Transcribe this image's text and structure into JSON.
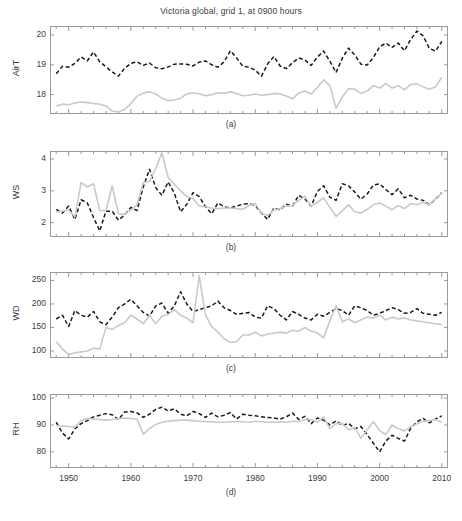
{
  "figure": {
    "title": "Victoria global, grid 1, at 0900 hours",
    "width": 462,
    "height": 521,
    "background": "#ffffff"
  },
  "style": {
    "observed_color": "#1a1a1a",
    "model_color": "#c9c9c9",
    "axis_color": "#9a9a9a",
    "text_color": "#3c3c3c"
  },
  "xaxis": {
    "label": "",
    "min": 1947,
    "max": 2011,
    "ticks": [
      1950,
      1960,
      1970,
      1980,
      1990,
      2000,
      2010
    ],
    "tick_labels": [
      "1950",
      "1960",
      "1970",
      "1980",
      "1990",
      "2000",
      "2010"
    ],
    "minor_tick_interval": 2
  },
  "captions": {
    "a": "(a)",
    "b": "(b)",
    "c": "(c)",
    "d": "(d)"
  },
  "chart_data": [
    {
      "type": "line",
      "panel": "(a)",
      "title": "Victoria global, grid 1, at 0900 hours",
      "xlabel": "",
      "ylabel": "AirT",
      "xlim": [
        1947,
        2011
      ],
      "ylim": [
        17.35,
        20.3
      ],
      "yticks": [
        18,
        19,
        20
      ],
      "ytick_labels": [
        "18",
        "19",
        "20"
      ],
      "grid": false,
      "legend": "none",
      "x": [
        1948,
        1949,
        1950,
        1951,
        1952,
        1953,
        1954,
        1955,
        1956,
        1957,
        1958,
        1959,
        1960,
        1961,
        1962,
        1963,
        1964,
        1965,
        1966,
        1967,
        1968,
        1969,
        1970,
        1971,
        1972,
        1973,
        1974,
        1975,
        1976,
        1977,
        1978,
        1979,
        1980,
        1981,
        1982,
        1983,
        1984,
        1985,
        1986,
        1987,
        1988,
        1989,
        1990,
        1991,
        1992,
        1993,
        1994,
        1995,
        1996,
        1997,
        1998,
        1999,
        2000,
        2001,
        2002,
        2003,
        2004,
        2005,
        2006,
        2007,
        2008,
        2009,
        2010
      ],
      "series": [
        {
          "name": "observed",
          "style": "dashed",
          "color": "#1a1a1a",
          "values": [
            18.7,
            18.95,
            18.92,
            19.05,
            19.26,
            19.13,
            19.43,
            19.1,
            18.93,
            18.76,
            18.62,
            18.88,
            19.05,
            19.1,
            18.98,
            19.06,
            18.9,
            18.87,
            18.93,
            19.02,
            19.03,
            19.02,
            18.96,
            19.09,
            19.13,
            19.0,
            18.92,
            19.1,
            19.47,
            19.23,
            18.95,
            18.92,
            18.82,
            18.62,
            19.03,
            19.28,
            18.96,
            18.87,
            19.07,
            19.23,
            19.16,
            18.98,
            19.26,
            19.46,
            19.12,
            18.74,
            19.22,
            19.56,
            19.33,
            19.02,
            18.99,
            19.24,
            19.6,
            19.73,
            19.58,
            19.73,
            19.47,
            19.85,
            20.13,
            19.97,
            19.55,
            19.46,
            19.78
          ]
        },
        {
          "name": "modelled",
          "style": "solid",
          "color": "#c9c9c9",
          "values": [
            17.62,
            17.68,
            17.66,
            17.72,
            17.75,
            17.73,
            17.7,
            17.68,
            17.62,
            17.45,
            17.42,
            17.5,
            17.7,
            17.95,
            18.05,
            18.1,
            18.02,
            17.88,
            17.8,
            17.82,
            17.88,
            18.02,
            18.06,
            18.02,
            17.96,
            18.0,
            18.06,
            18.04,
            18.1,
            18.04,
            17.96,
            17.98,
            18.02,
            17.98,
            18.0,
            18.04,
            18.02,
            17.95,
            17.86,
            18.05,
            18.12,
            18.02,
            18.24,
            18.5,
            18.3,
            17.54,
            17.92,
            18.2,
            18.18,
            18.04,
            18.12,
            18.3,
            18.22,
            18.38,
            18.22,
            18.3,
            18.16,
            18.34,
            18.36,
            18.26,
            18.18,
            18.26,
            18.58
          ]
        }
      ]
    },
    {
      "type": "line",
      "panel": "(b)",
      "title": "",
      "xlabel": "",
      "ylabel": "WS",
      "xlim": [
        1947,
        2011
      ],
      "ylim": [
        1.55,
        4.25
      ],
      "yticks": [
        2,
        3,
        4
      ],
      "ytick_labels": [
        "2",
        "3",
        "4"
      ],
      "grid": false,
      "legend": "none",
      "x": [
        1948,
        1949,
        1950,
        1951,
        1952,
        1953,
        1954,
        1955,
        1956,
        1957,
        1958,
        1959,
        1960,
        1961,
        1962,
        1963,
        1964,
        1965,
        1966,
        1967,
        1968,
        1969,
        1970,
        1971,
        1972,
        1973,
        1974,
        1975,
        1976,
        1977,
        1978,
        1979,
        1980,
        1981,
        1982,
        1983,
        1984,
        1985,
        1986,
        1987,
        1988,
        1989,
        1990,
        1991,
        1992,
        1993,
        1994,
        1995,
        1996,
        1997,
        1998,
        1999,
        2000,
        2001,
        2002,
        2003,
        2004,
        2005,
        2006,
        2007,
        2008,
        2009,
        2010
      ],
      "series": [
        {
          "name": "observed",
          "style": "dashed",
          "color": "#1a1a1a",
          "values": [
            2.42,
            2.3,
            2.52,
            2.1,
            2.72,
            2.62,
            2.16,
            1.74,
            2.36,
            2.36,
            2.08,
            2.24,
            2.48,
            2.38,
            3.12,
            3.68,
            3.1,
            2.86,
            3.28,
            2.92,
            2.34,
            2.58,
            2.94,
            2.82,
            2.5,
            2.28,
            2.62,
            2.5,
            2.46,
            2.52,
            2.58,
            2.6,
            2.54,
            2.3,
            2.1,
            2.46,
            2.4,
            2.58,
            2.52,
            2.86,
            2.74,
            2.52,
            2.98,
            3.16,
            2.8,
            2.7,
            3.22,
            3.16,
            2.96,
            2.74,
            2.9,
            3.18,
            3.22,
            3.04,
            2.88,
            3.06,
            2.78,
            2.86,
            2.74,
            2.7,
            2.56,
            2.74,
            2.94
          ]
        },
        {
          "name": "modelled",
          "style": "solid",
          "color": "#c9c9c9",
          "values": [
            2.34,
            2.36,
            2.4,
            2.18,
            3.26,
            3.12,
            3.22,
            2.38,
            2.38,
            3.16,
            2.28,
            2.26,
            2.4,
            2.56,
            3.26,
            3.3,
            3.7,
            4.2,
            3.42,
            3.2,
            3.0,
            2.82,
            2.76,
            2.52,
            2.5,
            2.46,
            2.44,
            2.46,
            2.46,
            2.44,
            2.42,
            2.54,
            2.6,
            2.3,
            2.22,
            2.4,
            2.44,
            2.52,
            2.54,
            2.7,
            2.82,
            2.52,
            2.64,
            2.78,
            2.48,
            2.2,
            2.38,
            2.56,
            2.34,
            2.3,
            2.42,
            2.56,
            2.62,
            2.52,
            2.4,
            2.54,
            2.44,
            2.6,
            2.56,
            2.64,
            2.56,
            2.76,
            2.92
          ]
        }
      ]
    },
    {
      "type": "line",
      "panel": "(c)",
      "title": "",
      "xlabel": "",
      "ylabel": "WD",
      "xlim": [
        1947,
        2011
      ],
      "ylim": [
        85,
        268
      ],
      "yticks": [
        100,
        150,
        200,
        250
      ],
      "ytick_labels": [
        "100",
        "150",
        "200",
        "250"
      ],
      "grid": false,
      "legend": "none",
      "x": [
        1948,
        1949,
        1950,
        1951,
        1952,
        1953,
        1954,
        1955,
        1956,
        1957,
        1958,
        1959,
        1960,
        1961,
        1962,
        1963,
        1964,
        1965,
        1966,
        1967,
        1968,
        1969,
        1970,
        1971,
        1972,
        1973,
        1974,
        1975,
        1976,
        1977,
        1978,
        1979,
        1980,
        1981,
        1982,
        1983,
        1984,
        1985,
        1986,
        1987,
        1988,
        1989,
        1990,
        1991,
        1992,
        1993,
        1994,
        1995,
        1996,
        1997,
        1998,
        1999,
        2000,
        2001,
        2002,
        2003,
        2004,
        2005,
        2006,
        2007,
        2008,
        2009,
        2010
      ],
      "series": [
        {
          "name": "observed",
          "style": "dashed",
          "color": "#1a1a1a",
          "values": [
            168,
            176,
            152,
            186,
            176,
            172,
            184,
            162,
            156,
            172,
            192,
            200,
            210,
            196,
            182,
            174,
            196,
            202,
            180,
            196,
            226,
            200,
            184,
            188,
            192,
            196,
            206,
            192,
            186,
            178,
            180,
            182,
            172,
            170,
            196,
            190,
            176,
            166,
            184,
            178,
            170,
            166,
            178,
            174,
            182,
            190,
            186,
            176,
            196,
            192,
            186,
            176,
            180,
            186,
            192,
            188,
            180,
            182,
            190,
            180,
            178,
            176,
            182
          ]
        },
        {
          "name": "modelled",
          "style": "solid",
          "color": "#c9c9c9",
          "values": [
            120,
            104,
            92,
            96,
            98,
            100,
            106,
            104,
            150,
            146,
            154,
            160,
            176,
            168,
            158,
            176,
            158,
            174,
            178,
            188,
            176,
            170,
            160,
            260,
            176,
            152,
            140,
            126,
            118,
            120,
            134,
            134,
            140,
            132,
            136,
            138,
            140,
            138,
            144,
            142,
            150,
            142,
            138,
            128,
            164,
            196,
            162,
            168,
            160,
            166,
            172,
            170,
            176,
            166,
            172,
            168,
            170,
            166,
            164,
            162,
            160,
            158,
            156
          ]
        }
      ]
    },
    {
      "type": "line",
      "panel": "(d)",
      "title": "",
      "xlabel": "",
      "ylabel": "RH",
      "xlim": [
        1947,
        2011
      ],
      "ylim": [
        74,
        101.5
      ],
      "yticks": [
        80,
        90,
        100
      ],
      "ytick_labels": [
        "80",
        "90",
        "100"
      ],
      "grid": false,
      "legend": "none",
      "x": [
        1948,
        1949,
        1950,
        1951,
        1952,
        1953,
        1954,
        1955,
        1956,
        1957,
        1958,
        1959,
        1960,
        1961,
        1962,
        1963,
        1964,
        1965,
        1966,
        1967,
        1968,
        1969,
        1970,
        1971,
        1972,
        1973,
        1974,
        1975,
        1976,
        1977,
        1978,
        1979,
        1980,
        1981,
        1982,
        1983,
        1984,
        1985,
        1986,
        1987,
        1988,
        1989,
        1990,
        1991,
        1992,
        1993,
        1994,
        1995,
        1996,
        1997,
        1998,
        1999,
        2000,
        2001,
        2002,
        2003,
        2004,
        2005,
        2006,
        2007,
        2008,
        2009,
        2010
      ],
      "series": [
        {
          "name": "observed",
          "style": "dashed",
          "color": "#1a1a1a",
          "values": [
            91.0,
            87.0,
            84.8,
            88.5,
            90.5,
            91.6,
            93.0,
            93.6,
            94.2,
            93.8,
            92.0,
            94.8,
            95.0,
            94.5,
            92.8,
            94.0,
            95.8,
            96.6,
            95.2,
            96.0,
            94.0,
            93.4,
            95.0,
            94.2,
            92.8,
            94.4,
            93.0,
            93.6,
            94.6,
            92.2,
            94.0,
            93.6,
            93.4,
            93.0,
            92.8,
            92.6,
            92.2,
            93.0,
            94.4,
            92.0,
            93.2,
            90.5,
            92.6,
            91.8,
            90.0,
            91.5,
            89.8,
            90.6,
            88.6,
            89.4,
            86.4,
            83.2,
            80.0,
            84.0,
            86.2,
            85.0,
            84.0,
            88.8,
            91.2,
            92.4,
            90.8,
            92.2,
            93.4
          ]
        },
        {
          "name": "modelled",
          "style": "solid",
          "color": "#c9c9c9",
          "values": [
            89.8,
            89.6,
            89.4,
            89.2,
            91.6,
            92.4,
            92.2,
            92.0,
            91.8,
            92.0,
            92.4,
            92.6,
            92.4,
            92.2,
            86.6,
            88.6,
            90.2,
            91.0,
            91.4,
            91.6,
            91.8,
            91.8,
            91.6,
            91.4,
            91.2,
            91.2,
            91.0,
            91.0,
            91.2,
            91.2,
            91.2,
            91.0,
            91.4,
            91.2,
            91.0,
            91.0,
            91.2,
            91.0,
            91.4,
            91.2,
            92.0,
            92.0,
            91.0,
            93.0,
            88.6,
            90.4,
            90.6,
            88.2,
            89.0,
            85.0,
            88.2,
            91.2,
            88.0,
            86.4,
            90.0,
            88.6,
            87.8,
            89.4,
            90.4,
            91.4,
            91.6,
            92.0,
            91.0
          ]
        }
      ]
    }
  ]
}
